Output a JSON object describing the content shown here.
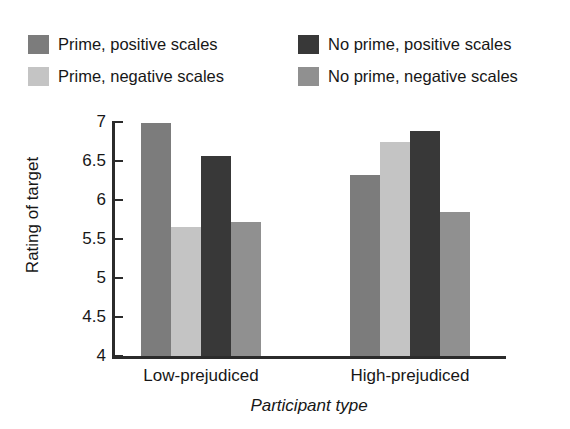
{
  "chart_data": {
    "type": "bar",
    "title": "",
    "xlabel": "Participant type",
    "ylabel": "Rating of target",
    "categories": [
      "Low-prejudiced",
      "High-prejudiced"
    ],
    "ylim": [
      4,
      7
    ],
    "yticks": [
      "4",
      "4.5",
      "5",
      "5.5",
      "6",
      "6.5",
      "7"
    ],
    "ytick_values": [
      4,
      4.5,
      5,
      5.5,
      6,
      6.5,
      7
    ],
    "grid": false,
    "legend_position": "top",
    "series": [
      {
        "name": "Prime, positive scales",
        "color": "#7c7c7c",
        "values": [
          6.99,
          6.32
        ]
      },
      {
        "name": "Prime, negative scales",
        "color": "#c4c4c4",
        "values": [
          5.65,
          6.75
        ]
      },
      {
        "name": "No prime, positive scales",
        "color": "#383838",
        "values": [
          6.56,
          6.88
        ]
      },
      {
        "name": "No prime, negative scales",
        "color": "#909090",
        "values": [
          5.72,
          5.85
        ]
      }
    ]
  },
  "legend": {
    "entries": [
      {
        "label": "Prime, positive scales",
        "color": "#7c7c7c"
      },
      {
        "label": "Prime, negative scales",
        "color": "#c4c4c4"
      },
      {
        "label": "No prime, positive scales",
        "color": "#383838"
      },
      {
        "label": "No prime, negative scales",
        "color": "#909090"
      }
    ]
  },
  "axes": {
    "y_title": "Rating of target",
    "x_title": "Participant type",
    "y_ticks": [
      "7",
      "6.5",
      "6",
      "5.5",
      "5",
      "4.5",
      "4"
    ],
    "x_ticks": [
      "Low-prejudiced",
      "High-prejudiced"
    ]
  }
}
